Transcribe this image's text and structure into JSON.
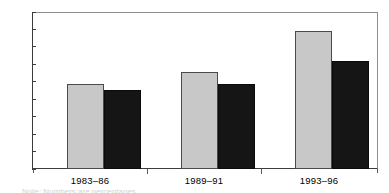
{
  "chart_data": {
    "type": "bar",
    "title": "",
    "subtitle": "",
    "xlabel": "",
    "ylabel": "",
    "categories": [
      "1983–86",
      "1989–91",
      "1993–96"
    ],
    "series": [
      {
        "name": "series-1-light",
        "color": "#c8c8c8",
        "values": [
          9.7,
          11.1,
          15.8
        ]
      },
      {
        "name": "series-2-dark",
        "color": "#151515",
        "values": [
          9.1,
          9.7,
          12.4
        ]
      }
    ],
    "ylim": [
      0,
      18
    ],
    "ytick_step": 2,
    "yticks": [
      "0",
      "2",
      "4",
      "6",
      "8",
      "10",
      "12",
      "14",
      "16",
      "18"
    ],
    "grid": false,
    "legend": "none",
    "frame": "box"
  },
  "axis": {
    "y_labels": [
      "18",
      "16",
      "14",
      "12",
      "10",
      "8",
      "6",
      "4",
      "2",
      "0"
    ],
    "x_labels": [
      "1983–86",
      "1989–91",
      "1993–96"
    ]
  },
  "footer": {
    "caption_fragment": "Note: Numbers are percentages"
  },
  "colors": {
    "light_bar": "#c8c8c8",
    "dark_bar": "#151515",
    "axis": "#3c3c3c",
    "frame": "#8e8e8e",
    "background": "#ffffff"
  }
}
